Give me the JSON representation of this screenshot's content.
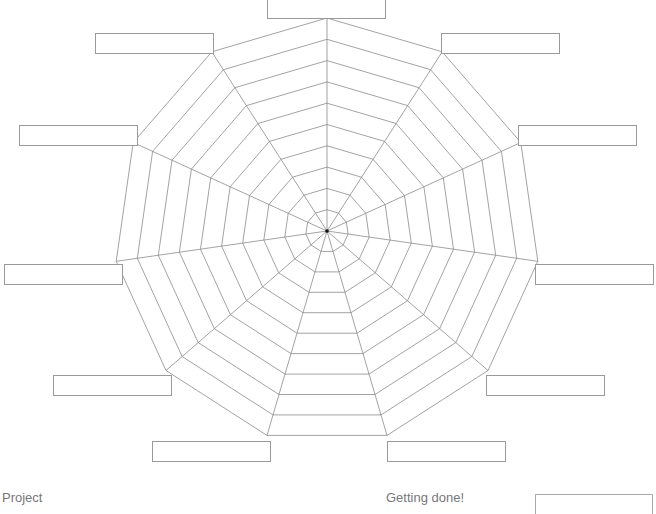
{
  "chart_data": {
    "type": "radar",
    "title": "",
    "axes_count": 11,
    "rings": 10,
    "axis_labels": [
      "",
      "",
      "",
      "",
      "",
      "",
      "",
      "",
      "",
      "",
      ""
    ],
    "series": [],
    "grid": true,
    "grid_color": "#8c8c8c",
    "center": [
      327,
      231
    ],
    "radius": 213
  },
  "label_boxes": [
    {
      "name": "axis-1-label",
      "x": 267,
      "y": -2,
      "text": ""
    },
    {
      "name": "axis-2-label",
      "x": 441,
      "y": 33,
      "text": ""
    },
    {
      "name": "axis-3-label",
      "x": 518,
      "y": 125,
      "text": ""
    },
    {
      "name": "axis-4-label",
      "x": 535,
      "y": 264,
      "text": ""
    },
    {
      "name": "axis-5-label",
      "x": 486,
      "y": 375,
      "text": ""
    },
    {
      "name": "axis-6-label",
      "x": 387,
      "y": 441,
      "text": ""
    },
    {
      "name": "axis-7-label",
      "x": 152,
      "y": 441,
      "text": ""
    },
    {
      "name": "axis-8-label",
      "x": 53,
      "y": 375,
      "text": ""
    },
    {
      "name": "axis-9-label",
      "x": 4,
      "y": 264,
      "text": ""
    },
    {
      "name": "axis-10-label",
      "x": 19,
      "y": 125,
      "text": ""
    },
    {
      "name": "axis-11-label",
      "x": 95,
      "y": 33,
      "text": ""
    }
  ],
  "footer": {
    "left_label": "Project",
    "right_label": "Getting done!",
    "input_value": ""
  }
}
